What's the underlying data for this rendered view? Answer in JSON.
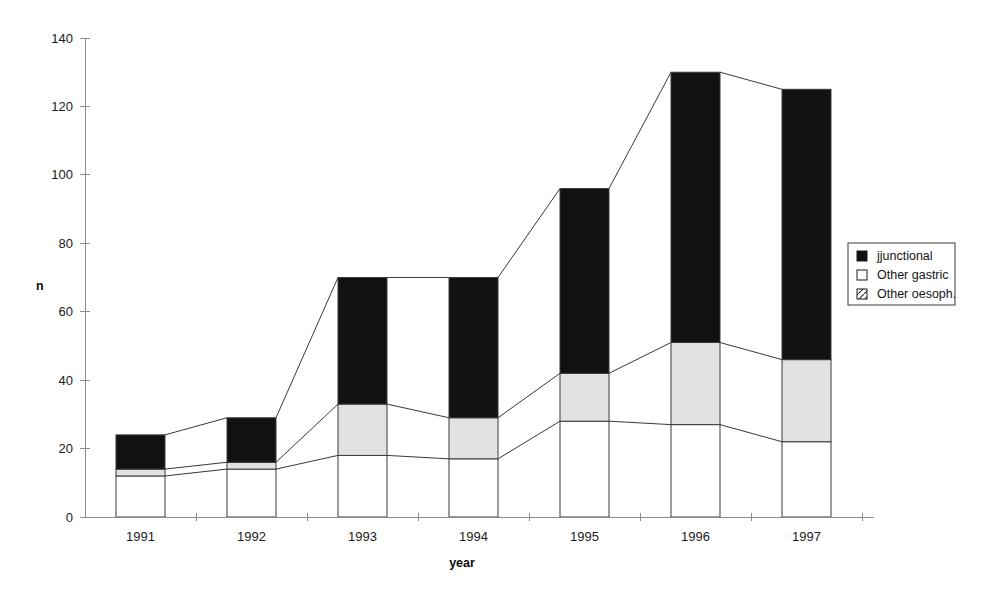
{
  "chart_data": {
    "type": "bar",
    "stacked": true,
    "title": "",
    "xlabel": "year",
    "ylabel": "n",
    "categories": [
      "1991",
      "1992",
      "1993",
      "1994",
      "1995",
      "1996",
      "1997"
    ],
    "series": [
      {
        "name": "Other oesoph.",
        "values": [
          12,
          14,
          18,
          17,
          28,
          27,
          22
        ],
        "fill": "#ffffff",
        "pattern": "hatch"
      },
      {
        "name": "Other gastric",
        "values": [
          2,
          2,
          15,
          12,
          14,
          24,
          24
        ],
        "fill": "#e2e2e2",
        "pattern": "solid"
      },
      {
        "name": "jjunctional",
        "values": [
          10,
          13,
          37,
          41,
          54,
          79,
          79
        ],
        "fill": "#111111",
        "pattern": "solid"
      }
    ],
    "totals": [
      24,
      29,
      70,
      70,
      96,
      130,
      125
    ],
    "ylim": [
      0,
      140
    ],
    "yticks": [
      0,
      20,
      40,
      60,
      80,
      100,
      120,
      140
    ],
    "ytick_labels": [
      "0",
      "20",
      "40",
      "60",
      "80",
      "100",
      "120",
      "140"
    ],
    "grid": false,
    "legend_position": "right",
    "connector_lines": true
  },
  "legend": {
    "entries": [
      {
        "label": "jjunctional",
        "swatch": "solid-black"
      },
      {
        "label": "Other gastric",
        "swatch": "empty-white"
      },
      {
        "label": "Other oesoph.",
        "swatch": "hatched"
      }
    ]
  },
  "axes": {
    "y_title": "n",
    "x_title": "year"
  },
  "colors": {
    "junctional": "#111111",
    "other_gastric": "#e2e2e2",
    "other_oesoph": "#ffffff",
    "axis": "#8c8c8c",
    "outline": "#3a3a3a"
  }
}
